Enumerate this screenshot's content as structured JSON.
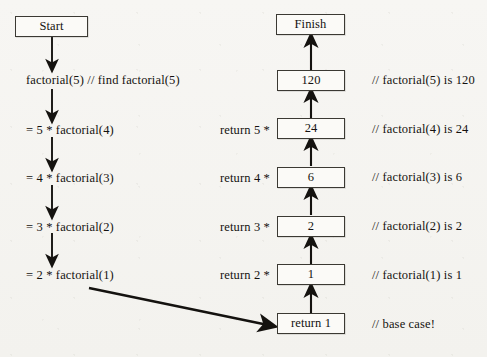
{
  "diagram": {
    "background_color": "#f6f5f2",
    "ink_color": "#14120f",
    "box_fill": "#fbfaf7",
    "start_node": {
      "label": "Start"
    },
    "finish_node": {
      "label": "Finish"
    },
    "base_case_node": {
      "label": "return 1"
    },
    "call_steps": [
      {
        "label": "factorial(5)  // find factorial(5)"
      },
      {
        "label": "= 5 * factorial(4)"
      },
      {
        "label": "= 4 * factorial(3)"
      },
      {
        "label": "= 3 * factorial(2)"
      },
      {
        "label": "= 2 * factorial(1)"
      }
    ],
    "return_labels": [
      {
        "label": "return 5 *"
      },
      {
        "label": "return 4 *"
      },
      {
        "label": "return 3 *"
      },
      {
        "label": "return 2 *"
      }
    ],
    "value_nodes": [
      {
        "label": "120"
      },
      {
        "label": "24"
      },
      {
        "label": "6"
      },
      {
        "label": "2"
      },
      {
        "label": "1"
      }
    ],
    "comments": [
      {
        "label": "// factorial(5) is 120"
      },
      {
        "label": "// factorial(4) is 24"
      },
      {
        "label": "// factorial(3) is 6"
      },
      {
        "label": "// factorial(2) is 2"
      },
      {
        "label": "// factorial(1) is 1"
      },
      {
        "label": "// base case!"
      }
    ]
  }
}
